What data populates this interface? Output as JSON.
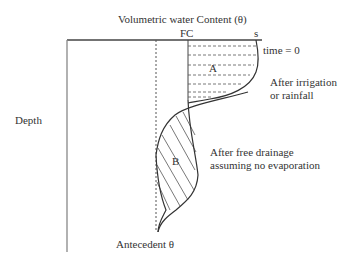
{
  "title": "Volumetric water Content (θ)",
  "axis": {
    "y_label": "Depth",
    "fc_label": "FC",
    "s_label": "s",
    "antecedent_label": "Antecedent θ"
  },
  "regions": {
    "a_label": "A",
    "b_label": "B"
  },
  "annotations": {
    "time_zero": "time = 0",
    "after_irrigation_line1": "After irrigation",
    "after_irrigation_line2": "or rainfall",
    "after_drainage_line1": "After free drainage",
    "after_drainage_line2": "assuming no evaporation"
  },
  "colors": {
    "line": "#444444",
    "text": "#333333"
  }
}
